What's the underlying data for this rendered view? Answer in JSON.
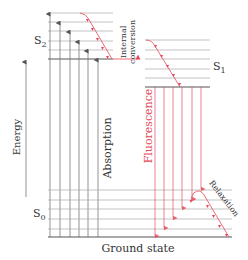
{
  "colors": {
    "level_line": "#9a9a9a",
    "level_line_thick": "#555555",
    "absorption": "#666666",
    "fluorescence": "#e8485a",
    "text": "#333333"
  },
  "labels": {
    "s2": "S",
    "s2_sub": "2",
    "s1": "S",
    "s1_sub": "1",
    "s0": "S",
    "s0_sub": "0",
    "energy": "Energy",
    "absorption": "Absorption",
    "internal_conversion_1": "Internal",
    "internal_conversion_2": "conversion",
    "fluorescence": "Fluorescence",
    "relaxation": "Relaxation",
    "ground_state": "Ground state"
  },
  "states": {
    "S2": {
      "x1": 48,
      "x2": 113,
      "levels_y": [
        13,
        22,
        31,
        41,
        50
      ],
      "base_y": 59
    },
    "S1": {
      "x1": 145,
      "x2": 210,
      "levels_y": [
        40,
        50,
        59,
        69,
        78
      ],
      "base_y": 87
    },
    "S0": {
      "x1": 48,
      "x2": 232,
      "levels_y": [
        190,
        200,
        209,
        219,
        229
      ],
      "base_y": 237
    }
  },
  "absorption_arrows_x": [
    50,
    60,
    70,
    79,
    88,
    98
  ],
  "fluorescence_arrows": [
    {
      "x": 155,
      "to_y": 237
    },
    {
      "x": 163,
      "to_y": 229
    },
    {
      "x": 173,
      "to_y": 219
    },
    {
      "x": 183,
      "to_y": 209
    },
    {
      "x": 193,
      "to_y": 200
    },
    {
      "x": 202,
      "to_y": 190
    }
  ]
}
